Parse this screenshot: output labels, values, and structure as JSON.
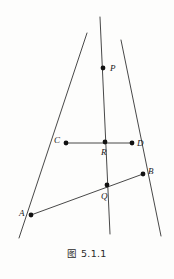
{
  "figure": {
    "caption": "图 5.1.1",
    "caption_y": 246,
    "background_color": "#fdfdfc",
    "stroke_color": "#333333",
    "point_color": "#111111",
    "stroke_width": 0.9,
    "point_radius": 2.4,
    "width": 174,
    "height": 279,
    "points": [
      {
        "id": "P",
        "label": "P",
        "x": 103,
        "y": 68,
        "label_x": 110,
        "label_y": 71
      },
      {
        "id": "C",
        "label": "C",
        "x": 66,
        "y": 143,
        "label_x": 54,
        "label_y": 143
      },
      {
        "id": "R",
        "label": "R",
        "x": 105,
        "y": 142,
        "label_x": 101,
        "label_y": 155
      },
      {
        "id": "D",
        "label": "D",
        "x": 132,
        "y": 143,
        "label_x": 137,
        "label_y": 146
      },
      {
        "id": "B",
        "label": "B",
        "x": 143,
        "y": 174,
        "label_x": 148,
        "label_y": 174
      },
      {
        "id": "Q",
        "label": "Q",
        "x": 107,
        "y": 185,
        "label_x": 101,
        "label_y": 199
      },
      {
        "id": "A",
        "label": "A",
        "x": 31,
        "y": 215,
        "label_x": 19,
        "label_y": 216
      }
    ],
    "segments": [
      {
        "id": "line-P-A-extended",
        "name": "line-through-P-C-A",
        "x1": 87,
        "y1": 33,
        "x2": 19,
        "y2": 238
      },
      {
        "id": "line-P-Q-extended",
        "name": "line-through-P-R-Q",
        "x1": 100,
        "y1": 17,
        "x2": 110,
        "y2": 234
      },
      {
        "id": "line-P-B-extended",
        "name": "line-through-P-D-B",
        "x1": 121,
        "y1": 40,
        "x2": 161,
        "y2": 236
      },
      {
        "id": "segment-C-D",
        "name": "segment-C-R-D",
        "x1": 66,
        "y1": 143,
        "x2": 132,
        "y2": 143
      },
      {
        "id": "segment-A-B",
        "name": "segment-A-Q-B",
        "x1": 31,
        "y1": 215,
        "x2": 143,
        "y2": 174
      }
    ]
  }
}
